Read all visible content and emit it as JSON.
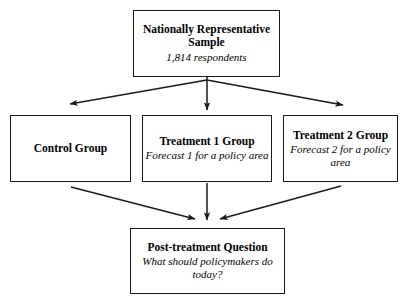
{
  "diagram": {
    "type": "flowchart",
    "line_color": "#1a1a1a",
    "background": "#ffffff",
    "nodes": {
      "sample": {
        "title": "Nationally Representative Sample",
        "subtitle": "1,814 respondents"
      },
      "control": {
        "title": "Control Group",
        "subtitle": ""
      },
      "treatment_1": {
        "title": "Treatment 1 Group",
        "subtitle": "Forecast 1 for a policy area"
      },
      "treatment_2": {
        "title": "Treatment 2 Group",
        "subtitle": "Forecast 2 for a policy area"
      },
      "post_treatment": {
        "title": "Post-treatment Question",
        "subtitle": "What should policymakers do today?"
      }
    },
    "edges": [
      {
        "from": "sample",
        "to": "control",
        "style": "arrow"
      },
      {
        "from": "sample",
        "to": "treatment_1",
        "style": "arrow"
      },
      {
        "from": "sample",
        "to": "treatment_2",
        "style": "arrow"
      },
      {
        "from": "control",
        "to": "post_treatment",
        "style": "arrow"
      },
      {
        "from": "treatment_1",
        "to": "post_treatment",
        "style": "arrow"
      },
      {
        "from": "treatment_2",
        "to": "post_treatment",
        "style": "arrow"
      }
    ]
  }
}
